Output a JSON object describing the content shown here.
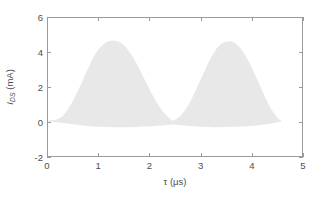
{
  "chart_data": {
    "type": "area",
    "title": "",
    "xlabel": "τ (μs)",
    "ylabel": "I_DS (mA)",
    "ylabel_main": "I",
    "ylabel_sub": "DS",
    "ylabel_unit": " (mA)",
    "xlabel_symbol": "τ",
    "xlabel_unit": "(μs)",
    "xlim": [
      0,
      5
    ],
    "ylim": [
      -2,
      6
    ],
    "xticks": [
      0,
      1,
      2,
      3,
      4,
      5
    ],
    "xticklabels": [
      "0",
      "1",
      "2",
      "3",
      "4",
      "5"
    ],
    "yticks": [
      -2,
      0,
      2,
      4,
      6
    ],
    "yticklabels": [
      "-2",
      "0",
      "2",
      "4",
      "6"
    ],
    "grid": false,
    "legend": false,
    "fill_color": "#e8e8e8",
    "axis_color": "#9a9a9a",
    "text_color": "#4d4d4d",
    "background": "#ffffff",
    "series": [
      {
        "name": "I_DS",
        "fill": true,
        "baseline": 0,
        "x": [
          0.0,
          0.1,
          0.2,
          0.3,
          0.4,
          0.5,
          0.6,
          0.7,
          0.8,
          0.9,
          1.0,
          1.1,
          1.2,
          1.3,
          1.4,
          1.5,
          1.6,
          1.7,
          1.8,
          1.9,
          2.0,
          2.1,
          2.2,
          2.3,
          2.4,
          2.45,
          2.5,
          2.6,
          2.7,
          2.8,
          2.9,
          3.0,
          3.1,
          3.2,
          3.3,
          3.4,
          3.5,
          3.6,
          3.7,
          3.8,
          3.9,
          4.0,
          4.1,
          4.2,
          4.3,
          4.4,
          4.5,
          4.6
        ],
        "y": [
          0.05,
          0.08,
          0.15,
          0.35,
          0.75,
          1.25,
          1.85,
          2.5,
          3.15,
          3.75,
          4.2,
          4.5,
          4.66,
          4.7,
          4.62,
          4.4,
          4.05,
          3.6,
          3.05,
          2.45,
          1.85,
          1.3,
          0.82,
          0.45,
          0.18,
          0.05,
          0.1,
          0.3,
          0.65,
          1.15,
          1.75,
          2.4,
          3.05,
          3.65,
          4.15,
          4.48,
          4.62,
          4.65,
          4.5,
          4.2,
          3.75,
          3.2,
          2.55,
          1.9,
          1.25,
          0.7,
          0.28,
          0.02
        ],
        "baseline_dip_x": [
          0.0,
          0.35,
          0.8,
          1.3,
          1.8,
          2.3,
          2.45,
          2.6,
          3.0,
          3.4,
          3.9,
          4.3,
          4.6
        ],
        "baseline_dip_y": [
          0.0,
          -0.1,
          -0.26,
          -0.33,
          -0.3,
          -0.22,
          -0.18,
          -0.22,
          -0.3,
          -0.33,
          -0.28,
          -0.16,
          0.0
        ]
      }
    ]
  }
}
